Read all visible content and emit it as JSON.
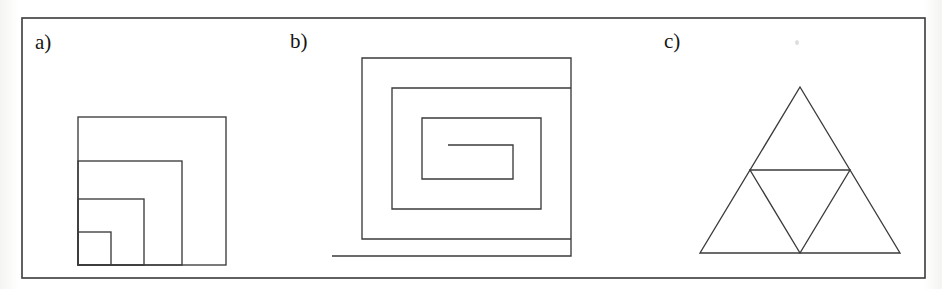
{
  "page": {
    "width": 942,
    "height": 289,
    "background_color": "#ffffff",
    "ink_color": "#333333",
    "frame": {
      "name": "outer-border-frame",
      "x": 22,
      "y": 18,
      "width": 903,
      "height": 260,
      "stroke_width": 1.6
    }
  },
  "labels": {
    "a": "a)",
    "b": "b)",
    "c": "c)"
  },
  "figures": [
    {
      "id": "a",
      "label": "a)",
      "name": "nested-squares-figure",
      "description": "Four nested squares sharing a common bottom-left corner",
      "anchor_corner": "bottom-left",
      "origin_x": 78,
      "origin_y": 265,
      "square_sides": [
        148,
        104,
        66,
        33
      ]
    },
    {
      "id": "b",
      "label": "b)",
      "name": "rectangular-spiral-figure",
      "description": "Rectangular spiral of three turns with a straight tail extending to the left at the bottom",
      "turns": 3,
      "ring_spacing": 30,
      "polyline": [
        [
          448,
          145
        ],
        [
          513,
          145
        ],
        [
          513,
          179
        ],
        [
          422,
          179
        ],
        [
          422,
          118
        ],
        [
          541,
          118
        ],
        [
          541,
          209
        ],
        [
          392,
          209
        ],
        [
          392,
          88
        ],
        [
          571,
          88
        ],
        [
          571,
          239
        ],
        [
          362,
          239
        ],
        [
          362,
          58
        ],
        [
          571,
          58
        ],
        [
          571,
          256
        ],
        [
          332,
          256
        ]
      ]
    },
    {
      "id": "c",
      "label": "c)",
      "name": "sierpinski-triangle-figure",
      "description": "Equilateral triangle subdivided by joining the midpoints of its three sides, forming four sub-triangles",
      "vertices": {
        "apex": [
          800,
          87
        ],
        "bottom_left": [
          700,
          253
        ],
        "bottom_right": [
          900,
          253
        ]
      },
      "midpoints": {
        "left": [
          750,
          170
        ],
        "right": [
          850,
          170
        ],
        "bottom": [
          800,
          253
        ]
      },
      "sub_triangle_count": 4
    }
  ]
}
